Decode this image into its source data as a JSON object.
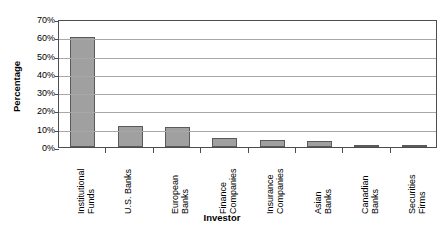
{
  "chart_data": {
    "type": "bar",
    "title": "",
    "xlabel": "Investor",
    "ylabel": "Percentage",
    "categories": [
      "Institutional Funds",
      "U.S. Banks",
      "European Banks",
      "Finance Companies",
      "Insurance Companies",
      "Asian Banks",
      "Canadian Banks",
      "Securities Firms"
    ],
    "category_lines": [
      [
        "Institutional",
        "Funds"
      ],
      [
        "U.S. Banks"
      ],
      [
        "European",
        "Banks"
      ],
      [
        "Finance",
        "Companies"
      ],
      [
        "Insurance",
        "Companies"
      ],
      [
        "Asian",
        "Banks"
      ],
      [
        "Canadian",
        "Banks"
      ],
      [
        "Securities",
        "Firms"
      ]
    ],
    "values": [
      60,
      11.5,
      11,
      5,
      4,
      3.5,
      1,
      1
    ],
    "ylim": [
      0,
      70
    ],
    "ytick_values": [
      0,
      10,
      20,
      30,
      40,
      50,
      60,
      70
    ],
    "ytick_labels": [
      "0%",
      "10%",
      "20%",
      "30%",
      "40%",
      "50%",
      "60%",
      "70%"
    ],
    "grid": "horizontal",
    "legend": "none",
    "bar_fill_color": "#a0a0a0",
    "bar_border_color": "#5a5a5a",
    "gridline_color": "#a8a8a8",
    "axis_color": "#4d4d4d",
    "plot_background": "#ffffff"
  },
  "footer": {
    "fragment": ""
  }
}
